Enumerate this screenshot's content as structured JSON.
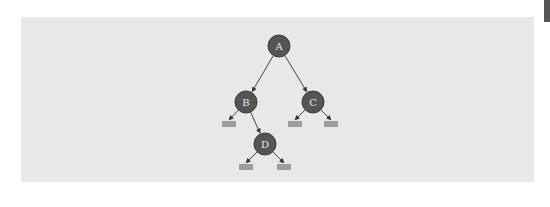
{
  "diagram": {
    "type": "binary-tree",
    "colors": {
      "background": "#ffffff",
      "panel": "#e8e8e8",
      "node_fill": "#555555",
      "node_stroke": "#3a3a3a",
      "node_text": "#e8e8e8",
      "edge": "#444444",
      "null_marker": "#444444",
      "edge_tab": "#555555"
    },
    "nodes": [
      {
        "id": "A",
        "label": "A",
        "x": 279,
        "y": 46
      },
      {
        "id": "B",
        "label": "B",
        "x": 246,
        "y": 102
      },
      {
        "id": "C",
        "label": "C",
        "x": 313,
        "y": 102
      },
      {
        "id": "D",
        "label": "D",
        "x": 265,
        "y": 144
      }
    ],
    "edges": [
      {
        "from": "A",
        "to": "B"
      },
      {
        "from": "A",
        "to": "C"
      },
      {
        "from": "B",
        "to": "null"
      },
      {
        "from": "B",
        "to": "D"
      },
      {
        "from": "C",
        "to": "null"
      },
      {
        "from": "C",
        "to": "null"
      },
      {
        "from": "D",
        "to": "null"
      },
      {
        "from": "D",
        "to": "null"
      }
    ],
    "null_markers": [
      {
        "parent": "B",
        "side": "left",
        "x": 229,
        "y": 122
      },
      {
        "parent": "C",
        "side": "left",
        "x": 295,
        "y": 122
      },
      {
        "parent": "C",
        "side": "right",
        "x": 331,
        "y": 122
      },
      {
        "parent": "D",
        "side": "left",
        "x": 246,
        "y": 165
      },
      {
        "parent": "D",
        "side": "right",
        "x": 284,
        "y": 165
      }
    ]
  }
}
